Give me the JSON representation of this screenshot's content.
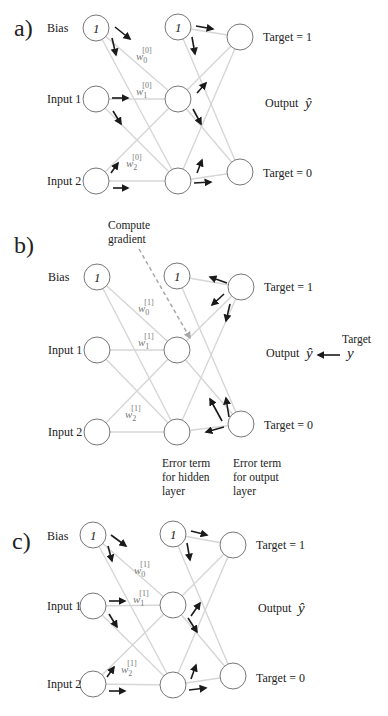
{
  "figure": {
    "colors": {
      "edge": "#d6d6d6",
      "node_stroke": "#777777",
      "arrow": "#1a1a1a",
      "dash": "#a8a8a8",
      "text": "#222222",
      "weight_text": "#777777"
    },
    "panels": [
      {
        "id": "a",
        "label": "a)",
        "label_pos": [
          14,
          28
        ],
        "row_labels": [
          {
            "text": "Bias",
            "x": 47,
            "y": 32
          },
          {
            "text": "Input 1",
            "x": 47,
            "y": 103
          },
          {
            "text": "Input 2",
            "x": 47,
            "y": 185
          }
        ],
        "nodes": {
          "in": [
            [
              96,
              28,
              "bias"
            ],
            [
              96,
              99,
              ""
            ],
            [
              96,
              181,
              ""
            ]
          ],
          "hid": [
            [
              178,
              27,
              "bias"
            ],
            [
              178,
              99,
              ""
            ],
            [
              178,
              181,
              ""
            ]
          ],
          "out": [
            [
              240,
              37,
              ""
            ],
            [
              240,
              172,
              ""
            ]
          ]
        },
        "weights": [
          {
            "base": "w",
            "sub": "0",
            "sup": "[0]",
            "x": 136,
            "y": 60
          },
          {
            "base": "w",
            "sub": "1",
            "sup": "[0]",
            "x": 136,
            "y": 95
          },
          {
            "base": "w",
            "sub": "2",
            "sup": "[0]",
            "x": 126,
            "y": 167
          }
        ],
        "targets": [
          {
            "text": "Target = 1",
            "x": 263,
            "y": 41
          },
          {
            "text": "Target = 0",
            "x": 263,
            "y": 177
          }
        ],
        "output": {
          "text": "Output",
          "x": 265,
          "y": 107,
          "symbol": "ŷ"
        },
        "arrows": [
          [
            115,
            27,
            130,
            39
          ],
          [
            112,
            38,
            116,
            55
          ],
          [
            112,
            98,
            128,
            98
          ],
          [
            113,
            111,
            121,
            124
          ],
          [
            111,
            173,
            118,
            163
          ],
          [
            113,
            188,
            128,
            188
          ],
          [
            196,
            26,
            213,
            29
          ],
          [
            192,
            37,
            195,
            54
          ],
          [
            197,
            93,
            206,
            83
          ],
          [
            193,
            109,
            201,
            124
          ],
          [
            197,
            173,
            202,
            160
          ],
          [
            194,
            183,
            211,
            182
          ]
        ]
      },
      {
        "id": "b",
        "label": "b)",
        "label_pos": [
          14,
          245
        ],
        "row_labels": [
          {
            "text": "Bias",
            "x": 48,
            "y": 281
          },
          {
            "text": "Input 1",
            "x": 48,
            "y": 354
          },
          {
            "text": "Input 2",
            "x": 48,
            "y": 436
          }
        ],
        "nodes": {
          "in": [
            [
              97,
              277,
              "bias"
            ],
            [
              97,
              350,
              ""
            ],
            [
              97,
              432,
              ""
            ]
          ],
          "hid": [
            [
              177,
              276,
              "bias"
            ],
            [
              177,
              350,
              ""
            ],
            [
              177,
              432,
              ""
            ]
          ],
          "out": [
            [
              241,
              287,
              ""
            ],
            [
              241,
              424,
              ""
            ]
          ]
        },
        "weights": [
          {
            "base": "w",
            "sub": "0",
            "sup": "[1]",
            "x": 138,
            "y": 312
          },
          {
            "base": "w",
            "sub": "1",
            "sup": "[1]",
            "x": 138,
            "y": 346
          },
          {
            "base": "w",
            "sub": "2",
            "sup": "[1]",
            "x": 125,
            "y": 418
          }
        ],
        "targets": [
          {
            "text": "Target = 1",
            "x": 264,
            "y": 291
          },
          {
            "text": "Target = 0",
            "x": 264,
            "y": 429
          }
        ],
        "output": {
          "text": "Output",
          "x": 266,
          "y": 357,
          "symbol": "ŷ"
        },
        "target_arrow": {
          "from": [
            340,
            355
          ],
          "to": [
            318,
            355
          ],
          "label": "Target",
          "label_x": 342,
          "label_y": 343,
          "symbol": "y",
          "symbol_x": 347,
          "symbol_y": 358
        },
        "compute_gradient": {
          "lines": [
            "Compute",
            "gradient"
          ],
          "x": 108,
          "y": 229,
          "dash_from": [
            139,
            249
          ],
          "dash_to": [
            190,
            338
          ]
        },
        "error_labels": [
          {
            "lines": [
              "Error term",
              "for hidden",
              "layer"
            ],
            "x": 162,
            "y": 467
          },
          {
            "lines": [
              "Error term",
              "for output",
              "layer"
            ],
            "x": 233,
            "y": 467
          }
        ],
        "arrows": [
          [
            227,
            283,
            210,
            277
          ],
          [
            224,
            294,
            212,
            305
          ],
          [
            230,
            304,
            226,
            321
          ],
          [
            222,
            421,
            210,
            399
          ],
          [
            229,
            417,
            226,
            398
          ],
          [
            224,
            427,
            206,
            432
          ]
        ]
      },
      {
        "id": "c",
        "label": "c)",
        "label_pos": [
          12,
          541
        ],
        "row_labels": [
          {
            "text": "Bias",
            "x": 47,
            "y": 540
          },
          {
            "text": "Input 1",
            "x": 47,
            "y": 610
          },
          {
            "text": "Input 2",
            "x": 47,
            "y": 688
          }
        ],
        "nodes": {
          "in": [
            [
              93,
              535,
              "bias"
            ],
            [
              93,
              606,
              ""
            ],
            [
              93,
              684,
              ""
            ]
          ],
          "hid": [
            [
              173,
              534,
              "bias"
            ],
            [
              173,
              605,
              ""
            ],
            [
              173,
              685,
              ""
            ]
          ],
          "out": [
            [
              233,
              545,
              ""
            ],
            [
              233,
              676,
              ""
            ]
          ]
        },
        "weights": [
          {
            "base": "w",
            "sub": "0",
            "sup": "[1]",
            "x": 134,
            "y": 574
          },
          {
            "base": "w",
            "sub": "1",
            "sup": "[1]",
            "x": 133,
            "y": 603
          },
          {
            "base": "w",
            "sub": "2",
            "sup": "[1]",
            "x": 121,
            "y": 673
          }
        ],
        "targets": [
          {
            "text": "Target = 1",
            "x": 256,
            "y": 549
          },
          {
            "text": "Target = 0",
            "x": 256,
            "y": 682
          }
        ],
        "output": {
          "text": "Output",
          "x": 258,
          "y": 612,
          "symbol": "ŷ"
        },
        "arrows": [
          [
            111,
            535,
            126,
            546
          ],
          [
            108,
            546,
            112,
            561
          ],
          [
            109,
            601,
            125,
            601
          ],
          [
            109,
            614,
            117,
            627
          ],
          [
            107,
            677,
            114,
            667
          ],
          [
            109,
            691,
            125,
            691
          ],
          [
            191,
            531,
            207,
            535
          ],
          [
            187,
            543,
            190,
            560
          ],
          [
            191,
            616,
            200,
            603
          ],
          [
            188,
            618,
            197,
            632
          ],
          [
            191,
            679,
            196,
            665
          ],
          [
            189,
            690,
            206,
            688
          ]
        ]
      }
    ]
  }
}
